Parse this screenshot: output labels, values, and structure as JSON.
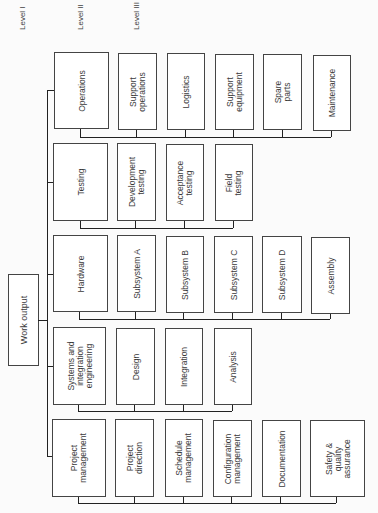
{
  "levels": {
    "level1": "Level I",
    "level2": "Level II",
    "level3": "Level III"
  },
  "root": {
    "label": "Work output"
  },
  "branches": [
    {
      "label": "Operations",
      "children": [
        "Support\noperations",
        "Logistics",
        "Support\nequipment",
        "Spare\nparts",
        "Maintenance"
      ]
    },
    {
      "label": "Testing",
      "children": [
        "Development\ntesting",
        "Acceptance\ntesting",
        "Field\ntesting"
      ]
    },
    {
      "label": "Hardware",
      "children": [
        "Subsystem A",
        "Subsystem B",
        "Subsystem C",
        "Subsystem D",
        "Assembly"
      ]
    },
    {
      "label": "Systems and\nintegration\nengineering",
      "children": [
        "Design",
        "Integration",
        "Analysis"
      ]
    },
    {
      "label": "Project\nmanagement",
      "children": [
        "Project\ndirection",
        "Schedule\nmanagement",
        "Configuration\nmanagement",
        "Documentation",
        "Safety &\nquality\nassurance"
      ]
    }
  ]
}
